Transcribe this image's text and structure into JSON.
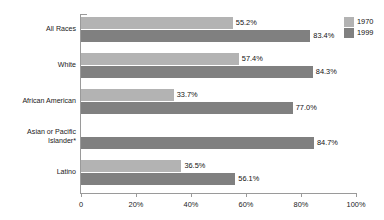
{
  "chart_data": {
    "type": "bar",
    "orientation": "horizontal",
    "title": "",
    "xlabel": "",
    "ylabel": "",
    "xlim": [
      0,
      100
    ],
    "grid": false,
    "legend_position": "top-right",
    "categories": [
      "All Races",
      "White",
      "African American",
      "Asian or Pacific\nIslander*",
      "Latino"
    ],
    "series": [
      {
        "name": "1970",
        "color": "#b3b3b3",
        "values": [
          55.2,
          57.4,
          33.7,
          null,
          36.5
        ],
        "labels": [
          "55.2%",
          "57.4%",
          "33.7%",
          "",
          "36.5%"
        ]
      },
      {
        "name": "1999",
        "color": "#808080",
        "values": [
          83.4,
          84.3,
          77.0,
          84.7,
          56.1
        ],
        "labels": [
          "83.4%",
          "84.3%",
          "77.0%",
          "84.7%",
          "56.1%"
        ]
      }
    ],
    "xticks": [
      0,
      20,
      40,
      60,
      80,
      100
    ],
    "xtick_labels": [
      "0",
      "20%",
      "40%",
      "60%",
      "80%",
      "100%"
    ]
  },
  "legend": {
    "items": [
      {
        "label": "1970",
        "color": "#b3b3b3"
      },
      {
        "label": "1999",
        "color": "#808080"
      }
    ]
  },
  "colors": {
    "series_1970": "#b3b3b3",
    "series_1999": "#808080",
    "axis": "#9a9a9a",
    "text": "#1a1a1a",
    "background": "#ffffff"
  }
}
